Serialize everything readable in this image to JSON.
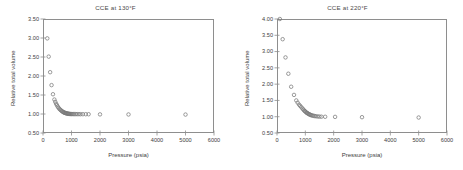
{
  "figure": {
    "panel_count": 2,
    "background_color": "#ffffff",
    "axis_color": "#8e8e8e",
    "marker_color": "#7a7a7a",
    "text_color": "#3d3d3d"
  },
  "chart_data": [
    {
      "type": "scatter",
      "panel": "left",
      "title": "CCE at 130°F",
      "xlabel": "Pressure (psia)",
      "ylabel": "Relative total volume",
      "xlim": [
        0,
        6000
      ],
      "ylim": [
        0.5,
        3.5
      ],
      "xticks": [
        0,
        1000,
        2000,
        3000,
        4000,
        5000,
        6000
      ],
      "xtick_labels": [
        "0",
        "1000",
        "2000",
        "3000",
        "4000",
        "5000",
        "6000"
      ],
      "yticks": [
        0.5,
        1.0,
        1.5,
        2.0,
        2.5,
        3.0,
        3.5
      ],
      "ytick_labels": [
        "0.50",
        "1.00",
        "1.50",
        "2.00",
        "2.50",
        "3.00",
        "3.50"
      ],
      "grid": false,
      "legend": null,
      "marker": "open-circle",
      "series": [
        {
          "name": "Relative total volume",
          "x": [
            150,
            200,
            250,
            300,
            350,
            400,
            430,
            460,
            490,
            520,
            550,
            580,
            610,
            640,
            665,
            690,
            710,
            730,
            750,
            770,
            790,
            810,
            830,
            850,
            870,
            890,
            910,
            935,
            960,
            990,
            1020,
            1060,
            1100,
            1150,
            1200,
            1260,
            1320,
            1400,
            1500,
            1600,
            2000,
            3000,
            5000
          ],
          "y": [
            2.99,
            2.51,
            2.1,
            1.76,
            1.52,
            1.38,
            1.32,
            1.27,
            1.23,
            1.19,
            1.16,
            1.13,
            1.11,
            1.09,
            1.075,
            1.06,
            1.05,
            1.043,
            1.036,
            1.03,
            1.025,
            1.02,
            1.016,
            1.012,
            1.009,
            1.006,
            1.004,
            1.002,
            1.0,
            0.999,
            0.998,
            0.998,
            0.997,
            0.997,
            0.996,
            0.996,
            0.995,
            0.995,
            0.994,
            0.994,
            0.99,
            0.988,
            0.985
          ]
        }
      ]
    },
    {
      "type": "scatter",
      "panel": "right",
      "title": "CCE at 220°F",
      "xlabel": "Pressure (psia)",
      "ylabel": "Relative total volume",
      "xlim": [
        0,
        6000
      ],
      "ylim": [
        0.5,
        4.0
      ],
      "xticks": [
        0,
        1000,
        2000,
        3000,
        4000,
        5000,
        6000
      ],
      "xtick_labels": [
        "0",
        "1000",
        "2000",
        "3000",
        "4000",
        "5000",
        "6000"
      ],
      "yticks": [
        0.5,
        1.0,
        1.5,
        2.0,
        2.5,
        3.0,
        3.5,
        4.0
      ],
      "ytick_labels": [
        "0.50",
        "1.00",
        "1.50",
        "2.00",
        "2.50",
        "3.00",
        "3.50",
        "4.00"
      ],
      "grid": false,
      "legend": null,
      "marker": "open-circle",
      "series": [
        {
          "name": "Relative total volume",
          "x": [
            100,
            200,
            300,
            400,
            500,
            600,
            680,
            730,
            780,
            820,
            860,
            900,
            930,
            960,
            985,
            1010,
            1035,
            1060,
            1085,
            1110,
            1135,
            1160,
            1185,
            1215,
            1250,
            1290,
            1330,
            1380,
            1440,
            1500,
            1570,
            1700,
            2050,
            3000,
            5000
          ],
          "y": [
            4.0,
            3.38,
            2.82,
            2.32,
            1.92,
            1.67,
            1.5,
            1.43,
            1.37,
            1.33,
            1.29,
            1.25,
            1.22,
            1.19,
            1.17,
            1.15,
            1.13,
            1.115,
            1.1,
            1.088,
            1.075,
            1.065,
            1.055,
            1.045,
            1.035,
            1.027,
            1.02,
            1.013,
            1.008,
            1.003,
            1.0,
            0.998,
            0.995,
            0.985,
            0.975
          ]
        }
      ]
    }
  ]
}
